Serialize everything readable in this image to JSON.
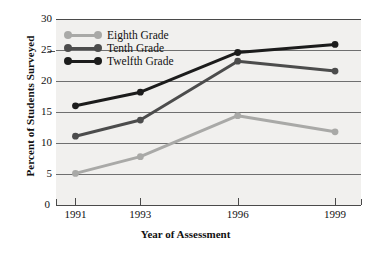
{
  "chart_data": {
    "type": "line",
    "title": "",
    "xlabel": "Year of Assessment",
    "ylabel": "Percent of Students Surveyed",
    "categories": [
      "1991",
      "1993",
      "1996",
      "1999"
    ],
    "x": [
      1991,
      1993,
      1996,
      1999
    ],
    "xlim": [
      1990.4,
      1999.8
    ],
    "ylim": [
      0,
      30
    ],
    "yticks": [
      0,
      5,
      10,
      15,
      20,
      25,
      30
    ],
    "grid": true,
    "legend_position": "top-left",
    "series": [
      {
        "name": "Eighth Grade",
        "color": "#a9a9a7",
        "values": [
          5.1,
          7.8,
          14.4,
          11.8
        ]
      },
      {
        "name": "Tenth Grade",
        "color": "#4c4c4c",
        "values": [
          11.1,
          13.7,
          23.2,
          21.6
        ]
      },
      {
        "name": "Twelfth Grade",
        "color": "#1c1c1c",
        "values": [
          16.0,
          18.2,
          24.6,
          25.9
        ]
      }
    ]
  },
  "colors": {
    "plot_background": "#f1f0ee",
    "gridline": "#6f6f6f",
    "axis": "#4a4a4a",
    "text": "#111111"
  }
}
